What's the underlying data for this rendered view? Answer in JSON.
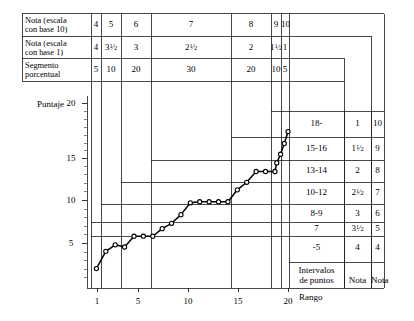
{
  "chart_data": {
    "type": "line",
    "title": "",
    "xlabel": "Rango",
    "ylabel": "Puntaje",
    "xlim": [
      0,
      21.5
    ],
    "ylim": [
      3.2,
      21.0
    ],
    "xticks": [
      1,
      5,
      10,
      15,
      20
    ],
    "yticks": [
      5,
      10,
      15,
      20
    ],
    "grid": false,
    "legend": "none",
    "series": [
      {
        "name": "Puntaje por rango",
        "marker": "open-circle",
        "x": [
          1,
          2,
          3,
          4,
          5,
          6,
          7,
          8,
          9,
          10,
          11,
          12,
          13,
          14,
          15,
          16,
          17,
          18,
          19,
          20
        ],
        "y": [
          5.0,
          6.6,
          7.2,
          7.0,
          8.0,
          8.0,
          8.0,
          8.7,
          9.2,
          10.0,
          11.1,
          11.2,
          11.2,
          11.2,
          11.2,
          12.3,
          13.0,
          14.0,
          14.0,
          14.0
        ]
      },
      {
        "name": "Puntaje por rango (cont.)",
        "marker": "open-circle",
        "x": [
          20.2,
          20.6,
          21.0,
          21.4
        ],
        "y": [
          14.8,
          15.6,
          16.6,
          17.7
        ]
      }
    ],
    "point_count": 24,
    "note": "Curva ojival escalonada de puntajes ordenados por rango"
  },
  "top_table": {
    "rows": [
      {
        "label": "Nota (escala\ncon base 10)",
        "label_line1": "Nota (escala",
        "label_line2": "con base 10)",
        "values": [
          "4",
          "5",
          "6",
          "7",
          "8",
          "9",
          "10"
        ]
      },
      {
        "label": "Nota (escala\ncon base 1)",
        "label_line1": "Nota (escala",
        "label_line2": "con base 1)",
        "values": [
          "4",
          "3½",
          "3",
          "2½",
          "2",
          "1½",
          "1"
        ]
      },
      {
        "label": "Segmento\nporcentual",
        "label_line1": "Segmento",
        "label_line2": "porcentual",
        "values": [
          "5",
          "10",
          "20",
          "30",
          "20",
          "10",
          "5"
        ]
      }
    ],
    "segment_widths_pct": [
      5,
      10,
      20,
      30,
      20,
      10,
      5
    ]
  },
  "right_table": {
    "rows": [
      {
        "interval": "18-",
        "nota1": "1",
        "nota10": "10"
      },
      {
        "interval": "15-16",
        "nota1": "1½",
        "nota10": "9"
      },
      {
        "interval": "13-14",
        "nota1": "2",
        "nota10": "8"
      },
      {
        "interval": "10-12",
        "nota1": "2½",
        "nota10": "7"
      },
      {
        "interval": "8-9",
        "nota1": "3",
        "nota10": "6"
      },
      {
        "interval": "7",
        "nota1": "3½",
        "nota10": "5"
      },
      {
        "interval": "-5",
        "nota1": "4",
        "nota10": "4"
      }
    ],
    "footer": {
      "interval_line1": "Intervalos",
      "interval_line2": "de puntos",
      "nota1": "Nota",
      "nota10": "Nota"
    }
  },
  "axes": {
    "y_title": "Puntaje",
    "x_title": "Rango",
    "y_tick_labels": [
      "20",
      "15",
      "10",
      "5"
    ],
    "x_tick_labels": [
      "1",
      "5",
      "10",
      "15",
      "20"
    ]
  },
  "colors": {
    "ink": "#000000",
    "rule": "#1a1a1a",
    "paper": "#ffffff"
  }
}
